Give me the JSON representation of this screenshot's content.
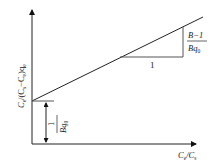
{
  "diagram": {
    "type": "linear plot schematic (BET-type isotherm linearization)",
    "y_axis": {
      "label_parts": [
        "C",
        "e",
        "/(C",
        "s",
        "−C",
        "e",
        ")q",
        "e"
      ]
    },
    "x_axis": {
      "label_parts": [
        "C",
        "e",
        "/C",
        "s"
      ]
    },
    "slope_triangle": {
      "run_label": "1",
      "rise_numerator": "B−1",
      "rise_denominator_main": "Bq",
      "rise_denominator_sub": "0"
    },
    "intercept": {
      "numerator": "1",
      "denominator_main": "Bq",
      "denominator_sub": "0"
    },
    "colors": {
      "line": "#222222",
      "triangle": "#555555"
    }
  }
}
